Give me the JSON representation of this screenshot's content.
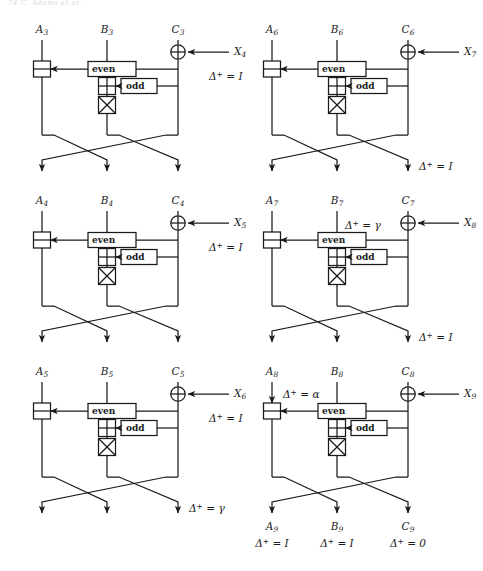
{
  "page": {
    "running_head": "74      C. Adams et al.",
    "width": 483,
    "height": 571,
    "ink_color": "#1a1a1a",
    "background": "#ffffff"
  },
  "gate_labels": {
    "even": "even",
    "odd": "odd"
  },
  "delta_symbol": "Δ",
  "columns": [
    {
      "name": "left-column",
      "blocks": [
        {
          "id": "block-1",
          "top_labels": {
            "a": "A",
            "a_sub": "3",
            "b": "B",
            "b_sub": "3",
            "c": "C",
            "c_sub": "3"
          },
          "x_input": {
            "symbol": "X",
            "sub": "4"
          },
          "delta_mid": {
            "text": "Δ⁺ = I",
            "base": "Δ",
            "sup": "+",
            "eq": "=",
            "value": "I"
          },
          "delta_top_b": null,
          "delta_top_a": null,
          "delta_out": null,
          "bottom_labels": null,
          "bottom_deltas": null
        },
        {
          "id": "block-2",
          "top_labels": {
            "a": "A",
            "a_sub": "4",
            "b": "B",
            "b_sub": "4",
            "c": "C",
            "c_sub": "4"
          },
          "x_input": {
            "symbol": "X",
            "sub": "5"
          },
          "delta_mid": {
            "text": "Δ⁺ = I",
            "base": "Δ",
            "sup": "+",
            "eq": "=",
            "value": "I"
          },
          "delta_top_b": null,
          "delta_top_a": null,
          "delta_out": null,
          "bottom_labels": null,
          "bottom_deltas": null
        },
        {
          "id": "block-3",
          "top_labels": {
            "a": "A",
            "a_sub": "5",
            "b": "B",
            "b_sub": "5",
            "c": "C",
            "c_sub": "5"
          },
          "x_input": {
            "symbol": "X",
            "sub": "6"
          },
          "delta_mid": {
            "text": "Δ⁺ = I",
            "base": "Δ",
            "sup": "+",
            "eq": "=",
            "value": "I"
          },
          "delta_top_b": null,
          "delta_top_a": null,
          "delta_out": {
            "base": "Δ",
            "sup": "+",
            "eq": "=",
            "value": "γ"
          },
          "bottom_labels": null,
          "bottom_deltas": null
        }
      ]
    },
    {
      "name": "right-column",
      "blocks": [
        {
          "id": "block-4",
          "top_labels": {
            "a": "A",
            "a_sub": "6",
            "b": "B",
            "b_sub": "6",
            "c": "C",
            "c_sub": "6"
          },
          "x_input": {
            "symbol": "X",
            "sub": "7"
          },
          "delta_mid": null,
          "delta_top_b": null,
          "delta_top_a": null,
          "delta_out": {
            "base": "Δ",
            "sup": "+",
            "eq": "=",
            "value": "I"
          },
          "bottom_labels": null,
          "bottom_deltas": null
        },
        {
          "id": "block-5",
          "top_labels": {
            "a": "A",
            "a_sub": "7",
            "b": "B",
            "b_sub": "7",
            "c": "C",
            "c_sub": "7"
          },
          "x_input": {
            "symbol": "X",
            "sub": "8"
          },
          "delta_mid": null,
          "delta_top_b": {
            "base": "Δ",
            "sup": "+",
            "eq": "=",
            "value": "γ"
          },
          "delta_top_a": null,
          "delta_out": {
            "base": "Δ",
            "sup": "+",
            "eq": "=",
            "value": "I"
          },
          "bottom_labels": null,
          "bottom_deltas": null
        },
        {
          "id": "block-6",
          "top_labels": {
            "a": "A",
            "a_sub": "8",
            "b": "B",
            "b_sub": "8",
            "c": "C",
            "c_sub": "8"
          },
          "x_input": {
            "symbol": "X",
            "sub": "9"
          },
          "delta_mid": null,
          "delta_top_b": null,
          "delta_top_a": {
            "base": "Δ",
            "sup": "+",
            "eq": "=",
            "value": "α"
          },
          "delta_out": null,
          "bottom_labels": {
            "a": "A",
            "a_sub": "9",
            "b": "B",
            "b_sub": "9",
            "c": "C",
            "c_sub": "9"
          },
          "bottom_deltas": [
            {
              "base": "Δ",
              "sup": "+",
              "eq": "=",
              "value": "I"
            },
            {
              "base": "Δ",
              "sup": "+",
              "eq": "=",
              "value": "I"
            },
            {
              "base": "Δ",
              "sup": "+",
              "eq": "=",
              "value": "0"
            }
          ]
        }
      ]
    }
  ]
}
